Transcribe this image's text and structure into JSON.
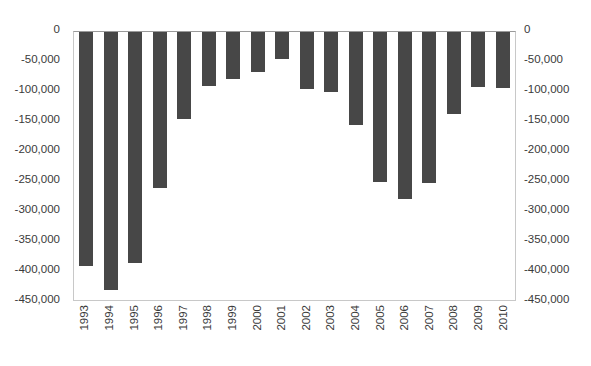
{
  "chart_data": {
    "type": "bar",
    "title": "",
    "subtitle": "",
    "xlabel": "",
    "ylabel": "",
    "ylim": [
      -450000,
      0
    ],
    "ytick_step": 50000,
    "grid": false,
    "legend": null,
    "bar_color": "#474747",
    "plot_border_color": "#c8c8c8",
    "axis_text_color": "#3a3a3a",
    "dual_y_axis": true,
    "categories": [
      "1993",
      "1994",
      "1995",
      "1996",
      "1997",
      "1998",
      "1999",
      "2000",
      "2001",
      "2002",
      "2003",
      "2004",
      "2005",
      "2006",
      "2007",
      "2008",
      "2009",
      "2010"
    ],
    "values": [
      -390000,
      -430000,
      -385000,
      -260000,
      -145000,
      -90000,
      -78000,
      -67000,
      -45000,
      -95000,
      -100000,
      -155000,
      -250000,
      -278000,
      -252000,
      -136000,
      -92000,
      -94000
    ],
    "yticks": [
      0,
      -50000,
      -100000,
      -150000,
      -200000,
      -250000,
      -300000,
      -350000,
      -400000,
      -450000
    ],
    "ytick_labels_left": [
      "0",
      "-50,000",
      "-100,000",
      "-150,000",
      "-200,000",
      "-250,000",
      "-300,000",
      "-350,000",
      "-400,000",
      "-450,000"
    ],
    "ytick_labels_right": [
      "0",
      "-50,000",
      "-100,000",
      "-150,000",
      "-200,000",
      "-250,000",
      "-300,000",
      "-350,000",
      "-400,000",
      "-450,000"
    ],
    "xtick_labels": [
      "1993",
      "1994",
      "1995",
      "1996",
      "1997",
      "1998",
      "1999",
      "2000",
      "2001",
      "2002",
      "2003",
      "2004",
      "2005",
      "2006",
      "2007",
      "2008",
      "2009",
      "2010"
    ]
  }
}
